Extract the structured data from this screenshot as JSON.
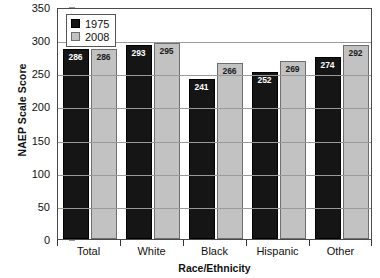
{
  "chart_data": {
    "type": "bar",
    "title": "",
    "xlabel": "Race/Ethnicity",
    "ylabel": "NAEP Scale Score",
    "categories": [
      "Total",
      "White",
      "Black",
      "Hispanic",
      "Other"
    ],
    "series": [
      {
        "name": "1975",
        "color": "#151515",
        "values": [
          286,
          293,
          241,
          252,
          274
        ]
      },
      {
        "name": "2008",
        "color": "#c2c2c2",
        "values": [
          286,
          295,
          266,
          269,
          292
        ]
      }
    ],
    "ylim": [
      0,
      350
    ],
    "ytick_values": [
      0,
      50,
      100,
      150,
      200,
      250,
      300,
      350
    ],
    "ytick_labels": [
      "0",
      "50",
      "100",
      "150",
      "200",
      "250",
      "300",
      "350"
    ],
    "grid": true,
    "legend_position": "top-left-inside",
    "value_labels_shown": true
  },
  "legend": {
    "entries": [
      {
        "label": "1975"
      },
      {
        "label": "2008"
      }
    ]
  },
  "axes": {
    "y_title": "NAEP Scale Score",
    "x_title": "Race/Ethnicity"
  }
}
